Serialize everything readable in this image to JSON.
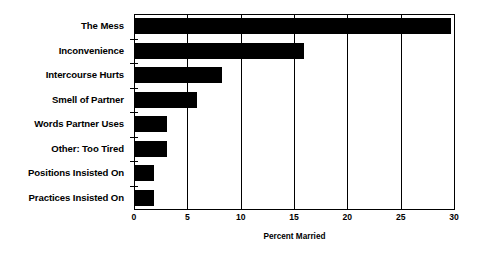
{
  "chart_data": {
    "type": "bar",
    "orientation": "horizontal",
    "title": "",
    "subtitle": "",
    "xlabel": "Percent Married",
    "ylabel": "",
    "xlim": [
      0,
      30
    ],
    "ylim": null,
    "grid": true,
    "grid_axis": "x",
    "legend": false,
    "legend_position": "none",
    "bar_color": "#000000",
    "background_color": "#ffffff",
    "xticks": [
      0,
      5,
      10,
      15,
      20,
      25,
      30
    ],
    "xticklabels": [
      "0",
      "5",
      "10",
      "15",
      "20",
      "25",
      "30"
    ],
    "categories": [
      "The Mess",
      "Inconvenience",
      "Intercourse Hurts",
      "Smell of Partner",
      "Words Partner Uses",
      "Other: Too Tired",
      "Positions Insisted On",
      "Practices Insisted On"
    ],
    "values": [
      29.6,
      15.8,
      8.2,
      5.8,
      3.0,
      3.0,
      1.8,
      1.8
    ],
    "series": [
      {
        "name": "Percent Married",
        "values": [
          29.6,
          15.8,
          8.2,
          5.8,
          3.0,
          3.0,
          1.8,
          1.8
        ]
      }
    ]
  }
}
